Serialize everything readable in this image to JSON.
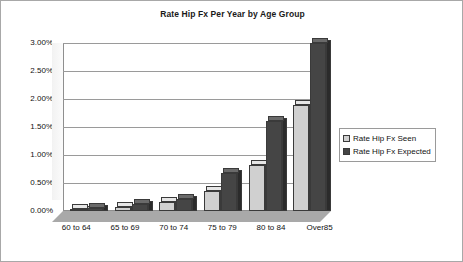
{
  "chart_data": {
    "type": "bar",
    "title": "Rate Hip Fx Per Year by Age Group",
    "xlabel": "",
    "ylabel": "",
    "categories": [
      "60 to 64",
      "65 to 69",
      "70 to 74",
      "75 to 79",
      "80 to 84",
      "Over85"
    ],
    "series": [
      {
        "name": "Rate Hip Fx Seen",
        "color": "#d0d0d0",
        "values": [
          0.04,
          0.07,
          0.16,
          0.35,
          0.82,
          1.9
        ]
      },
      {
        "name": "Rate Hip Fx Expected",
        "color": "#454545",
        "values": [
          0.06,
          0.13,
          0.22,
          0.67,
          1.6,
          3.0
        ]
      }
    ],
    "ylim": [
      0,
      3.0
    ],
    "ytick_labels": [
      "3.00%",
      "2.50%",
      "2.00%",
      "1.50%",
      "1.00%",
      "0.50%",
      "0.00%"
    ],
    "ytick_values": [
      3.0,
      2.5,
      2.0,
      1.5,
      1.0,
      0.5,
      0.0
    ],
    "yaxis_unit": "%",
    "grid": true,
    "legend_position": "right",
    "style": "3d-column",
    "value_format": "0.00%"
  },
  "legend": {
    "items": [
      {
        "label": "Rate Hip Fx Seen"
      },
      {
        "label": "Rate Hip Fx Expected"
      }
    ]
  },
  "colors": {
    "seen": "#d0d0d0",
    "expected": "#454545",
    "gridline": "#9a9a9a",
    "border": "#a8a8a8",
    "floor": "#a9a9a9",
    "text": "#111111"
  }
}
